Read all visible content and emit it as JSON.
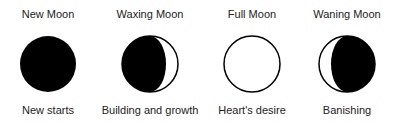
{
  "phases": [
    {
      "title": "New Moon",
      "caption": "New starts",
      "icon": "new-moon-icon"
    },
    {
      "title": "Waxing Moon",
      "caption": "Building and growth",
      "icon": "waxing-moon-icon"
    },
    {
      "title": "Full Moon",
      "caption": "Heart's desire",
      "icon": "full-moon-icon"
    },
    {
      "title": "Waning Moon",
      "caption": "Banishing",
      "icon": "waning-moon-icon"
    }
  ]
}
